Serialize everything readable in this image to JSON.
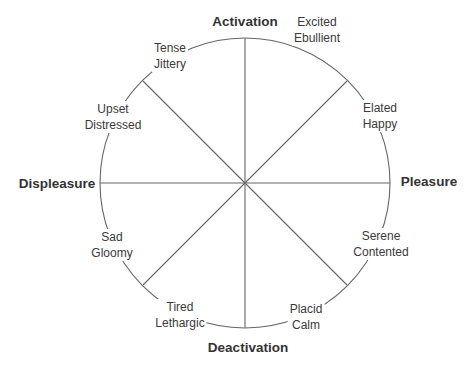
{
  "diagram": {
    "type": "circumplex",
    "axes": {
      "top": "Activation",
      "bottom": "Deactivation",
      "left": "Displeasure",
      "right": "Pleasure"
    },
    "states": [
      {
        "line1": "Excited",
        "line2": "Ebullient"
      },
      {
        "line1": "Elated",
        "line2": "Happy"
      },
      {
        "line1": "Serene",
        "line2": "Contented"
      },
      {
        "line1": "Placid",
        "line2": "Calm"
      },
      {
        "line1": "Tired",
        "line2": "Lethargic"
      },
      {
        "line1": "Sad",
        "line2": "Gloomy"
      },
      {
        "line1": "Upset",
        "line2": "Distressed"
      },
      {
        "line1": "Tense",
        "line2": "Jittery"
      }
    ],
    "colors": {
      "line": "#555555",
      "text": "#333333"
    }
  }
}
